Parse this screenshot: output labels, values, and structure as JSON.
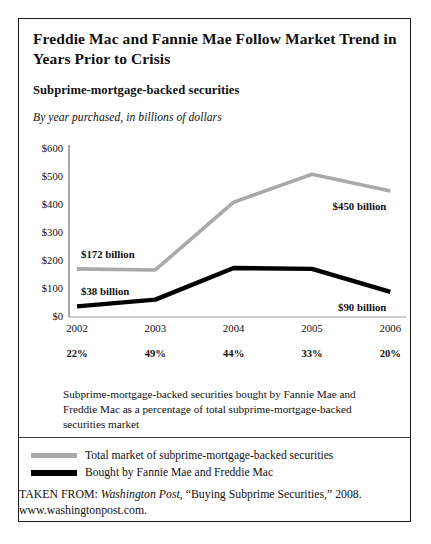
{
  "title": "Freddie Mac and Fannie Mae Follow Market Trend in Years Prior to Crisis",
  "subtitle": "Subprime-mortgage-backed securities",
  "caption": "By year purchased, in billions of dollars",
  "footnote": "Subprime-mortgage-backed securities bought by Fannie Mae and Freddie Mac as a percentage of total subprime-mortgage-backed securities market",
  "legend": [
    {
      "label": "Total market of subprime-mortgage-backed securities",
      "color": "#a9a9a9",
      "style": "gray"
    },
    {
      "label": "Bought by Fannie Mae and Freddie Mac",
      "color": "#000000",
      "style": "black"
    }
  ],
  "source": {
    "prefix": "TAKEN FROM: ",
    "publication": "Washington Post",
    "rest": ", “Buying Subprime Securities,” 2008.",
    "url": "www.washingtonpost.com."
  },
  "chart_data": {
    "type": "line",
    "title": "Subprime-mortgage-backed securities",
    "subtitle": "By year purchased, in billions of dollars",
    "xlabel": "",
    "ylabel": "",
    "categories": [
      "2002",
      "2003",
      "2004",
      "2005",
      "2006"
    ],
    "ylim": [
      0,
      600
    ],
    "yticks": [
      "$0",
      "$100",
      "$200",
      "$300",
      "$400",
      "$500",
      "$600"
    ],
    "ytick_values": [
      0,
      100,
      200,
      300,
      400,
      500,
      600
    ],
    "grid": false,
    "legend_position": "bottom",
    "series": [
      {
        "name": "Total market of subprime-mortgage-backed securities",
        "color": "#a9a9a9",
        "values": [
          172,
          168,
          410,
          510,
          450
        ]
      },
      {
        "name": "Bought by Fannie Mae and Freddie Mac",
        "color": "#000000",
        "values": [
          38,
          62,
          175,
          172,
          90
        ]
      }
    ],
    "annotations": [
      {
        "text": "$172 billion",
        "series": "Total market of subprime-mortgage-backed securities",
        "category": "2002"
      },
      {
        "text": "$38 billion",
        "series": "Bought by Fannie Mae and Freddie Mac",
        "category": "2002"
      },
      {
        "text": "$450 billion",
        "series": "Total market of subprime-mortgage-backed securities",
        "category": "2006"
      },
      {
        "text": "$90 billion",
        "series": "Bought by Fannie Mae and Freddie Mac",
        "category": "2006"
      }
    ],
    "percent_row": [
      "22%",
      "49%",
      "44%",
      "33%",
      "20%"
    ],
    "percent_row_note": "Subprime-mortgage-backed securities bought by Fannie Mae and Freddie Mac as a percentage of total subprime-mortgage-backed securities market"
  }
}
